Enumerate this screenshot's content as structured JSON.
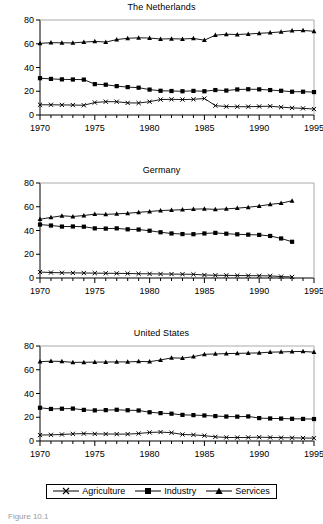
{
  "figure": {
    "caption_fragment": "Figure 10.1",
    "legend": {
      "items": [
        {
          "label": "Agriculture",
          "marker": "x-marker-icon"
        },
        {
          "label": "Industry",
          "marker": "filled-square-marker-icon"
        },
        {
          "label": "Services",
          "marker": "filled-triangle-marker-icon"
        }
      ]
    }
  },
  "chart_data": [
    {
      "type": "line",
      "title": "The Netherlands",
      "xlabel": "",
      "ylabel": "",
      "xlim": [
        1970,
        1995
      ],
      "ylim": [
        0,
        80
      ],
      "yticks": [
        0,
        20,
        40,
        60,
        80
      ],
      "xticks": [
        1970,
        1975,
        1980,
        1985,
        1990,
        1995
      ],
      "grid": false,
      "legend_position": "below-figure",
      "x": [
        1970,
        1971,
        1972,
        1973,
        1974,
        1975,
        1976,
        1977,
        1978,
        1979,
        1980,
        1981,
        1982,
        1983,
        1984,
        1985,
        1986,
        1987,
        1988,
        1989,
        1990,
        1991,
        1992,
        1993,
        1994,
        1995
      ],
      "series": [
        {
          "name": "Agriculture",
          "marker": "x",
          "values": [
            8.6,
            8.6,
            8.5,
            8.4,
            8.2,
            10.5,
            11.2,
            11.2,
            10.2,
            10.1,
            11.2,
            13.0,
            13.2,
            13.0,
            13.2,
            13.9,
            7.9,
            7.1,
            7.0,
            7.0,
            7.2,
            7.4,
            6.6,
            6.0,
            5.6,
            5.0
          ]
        },
        {
          "name": "Industry",
          "marker": "square",
          "values": [
            31.0,
            30.4,
            30.0,
            29.9,
            29.8,
            26.0,
            25.5,
            24.3,
            23.5,
            23.0,
            21.4,
            20.4,
            20.2,
            20.0,
            20.3,
            20.0,
            21.0,
            20.6,
            21.5,
            21.7,
            21.6,
            21.0,
            20.4,
            19.6,
            19.6,
            19.3
          ]
        },
        {
          "name": "Services",
          "marker": "triangle",
          "values": [
            60.3,
            60.9,
            60.8,
            60.7,
            61.4,
            62.0,
            61.4,
            63.5,
            64.6,
            65.0,
            64.8,
            64.0,
            64.2,
            64.0,
            64.5,
            63.0,
            67.2,
            68.0,
            67.8,
            68.2,
            68.8,
            69.3,
            70.0,
            71.0,
            71.2,
            70.5
          ]
        }
      ]
    },
    {
      "type": "line",
      "title": "Germany",
      "xlabel": "",
      "ylabel": "",
      "xlim": [
        1970,
        1995
      ],
      "ylim": [
        0,
        80
      ],
      "yticks": [
        0,
        20,
        40,
        60,
        80
      ],
      "xticks": [
        1970,
        1975,
        1980,
        1985,
        1990,
        1995
      ],
      "grid": false,
      "legend_position": "below-figure",
      "x": [
        1970,
        1971,
        1972,
        1973,
        1974,
        1975,
        1976,
        1977,
        1978,
        1979,
        1980,
        1981,
        1982,
        1983,
        1984,
        1985,
        1986,
        1987,
        1988,
        1989,
        1990,
        1991,
        1992,
        1993
      ],
      "series": [
        {
          "name": "Agriculture",
          "marker": "x",
          "values": [
            5.0,
            4.6,
            4.4,
            4.3,
            4.2,
            4.1,
            4.0,
            3.9,
            3.8,
            3.6,
            3.5,
            3.4,
            3.3,
            3.2,
            3.1,
            2.5,
            2.3,
            2.2,
            2.1,
            2.0,
            1.9,
            1.8,
            1.2,
            0.9
          ]
        },
        {
          "name": "Industry",
          "marker": "square",
          "values": [
            45.0,
            44.2,
            43.3,
            43.4,
            43.2,
            41.8,
            41.6,
            41.8,
            41.0,
            40.8,
            39.8,
            38.5,
            37.5,
            37.0,
            36.9,
            37.5,
            38.0,
            37.3,
            36.8,
            36.5,
            36.3,
            35.4,
            33.3,
            30.5
          ]
        },
        {
          "name": "Services",
          "marker": "triangle",
          "values": [
            49.5,
            51.0,
            52.4,
            51.8,
            52.6,
            53.8,
            53.6,
            54.0,
            54.5,
            55.3,
            56.0,
            56.8,
            57.2,
            57.5,
            58.0,
            58.2,
            57.8,
            58.2,
            58.8,
            59.6,
            60.6,
            62.0,
            63.0,
            65.0
          ]
        }
      ]
    },
    {
      "type": "line",
      "title": "United States",
      "xlabel": "",
      "ylabel": "",
      "xlim": [
        1970,
        1995
      ],
      "ylim": [
        0,
        80
      ],
      "yticks": [
        0,
        20,
        40,
        60,
        80
      ],
      "xticks": [
        1970,
        1975,
        1980,
        1985,
        1990,
        1995
      ],
      "grid": false,
      "legend_position": "below-figure",
      "x": [
        1970,
        1971,
        1972,
        1973,
        1974,
        1975,
        1976,
        1977,
        1978,
        1979,
        1980,
        1981,
        1982,
        1983,
        1984,
        1985,
        1986,
        1987,
        1988,
        1989,
        1990,
        1991,
        1992,
        1993,
        1994,
        1995
      ],
      "series": [
        {
          "name": "Agriculture",
          "marker": "x",
          "values": [
            5.0,
            5.2,
            5.5,
            6.0,
            6.2,
            6.0,
            5.9,
            5.8,
            5.8,
            6.3,
            7.2,
            7.5,
            7.0,
            5.5,
            5.2,
            4.5,
            3.5,
            3.0,
            2.9,
            3.0,
            3.2,
            3.0,
            2.8,
            2.7,
            2.5,
            2.4
          ]
        },
        {
          "name": "Industry",
          "marker": "square",
          "values": [
            28.0,
            27.0,
            27.2,
            27.3,
            26.2,
            25.8,
            26.0,
            26.3,
            25.9,
            25.7,
            24.2,
            23.5,
            23.0,
            22.0,
            21.8,
            21.5,
            21.0,
            20.6,
            20.5,
            20.7,
            19.3,
            19.0,
            18.9,
            18.7,
            18.6,
            18.5
          ]
        },
        {
          "name": "Services",
          "marker": "triangle",
          "values": [
            66.8,
            67.2,
            67.0,
            66.2,
            66.3,
            66.4,
            66.5,
            66.6,
            66.6,
            67.0,
            66.8,
            68.2,
            70.0,
            69.8,
            71.0,
            73.0,
            73.3,
            73.6,
            73.8,
            74.0,
            74.2,
            74.8,
            75.0,
            75.3,
            75.4,
            74.8
          ]
        }
      ]
    }
  ]
}
